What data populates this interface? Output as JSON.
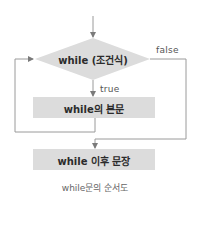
{
  "diagram": {
    "type": "flowchart",
    "nodes": {
      "condition": {
        "label": "while (조건식)",
        "shape": "diamond"
      },
      "body": {
        "label": "while의 본문",
        "shape": "rect"
      },
      "after": {
        "label": "while 이후 문장",
        "shape": "rect"
      }
    },
    "edges": {
      "true_label": "true",
      "false_label": "false"
    },
    "caption": "while문의 순서도",
    "colors": {
      "node_fill": "#dcdcdc",
      "line": "#9a9a9a",
      "arrow": "#7a7a7a",
      "text": "#2b2b2b"
    }
  }
}
